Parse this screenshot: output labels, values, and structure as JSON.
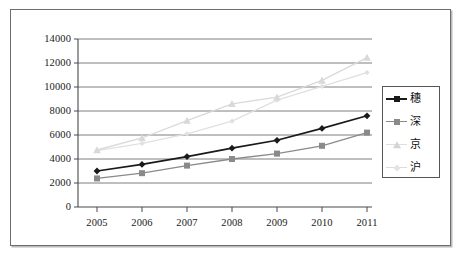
{
  "chart_data": {
    "type": "line",
    "title": "",
    "xlabel": "",
    "ylabel": "",
    "categories": [
      "2005",
      "2006",
      "2007",
      "2008",
      "2009",
      "2010",
      "2011"
    ],
    "x": [
      2005,
      2006,
      2007,
      2008,
      2009,
      2010,
      2011
    ],
    "ylim": [
      0,
      14000
    ],
    "ytick_step": 2000,
    "yticks": [
      "0",
      "2000",
      "4000",
      "6000",
      "8000",
      "10000",
      "12000",
      "14000"
    ],
    "grid": "horizontal",
    "legend_position": "right",
    "series": [
      {
        "name": "穗",
        "marker": "diamond",
        "color": "#1a1a1a",
        "values": [
          3000,
          3550,
          4200,
          4900,
          5560,
          6550,
          7600
        ]
      },
      {
        "name": "深",
        "marker": "square",
        "color": "#8a8a8a",
        "values": [
          2380,
          2820,
          3450,
          4000,
          4450,
          5100,
          6200
        ]
      },
      {
        "name": "京",
        "marker": "triangle",
        "color": "#d9d9d9",
        "values": [
          4750,
          5750,
          7200,
          8600,
          9150,
          10550,
          12450
        ]
      },
      {
        "name": "沪",
        "marker": "line",
        "color": "#e0e0e0",
        "values": [
          4700,
          5300,
          6100,
          7150,
          8900,
          10050,
          11200
        ]
      }
    ]
  },
  "axis": {
    "y_ticks": [
      "14000",
      "12000",
      "10000",
      "8000",
      "6000",
      "4000",
      "2000",
      "0"
    ],
    "x_ticks": [
      "2005",
      "2006",
      "2007",
      "2008",
      "2009",
      "2010",
      "2011"
    ]
  },
  "legend": {
    "items": [
      {
        "label": "穗",
        "marker": "diamond-marker",
        "color": "#1a1a1a"
      },
      {
        "label": "深",
        "marker": "square-marker",
        "color": "#8a8a8a"
      },
      {
        "label": "京",
        "marker": "triangle-marker",
        "color": "#d4d4d4"
      },
      {
        "label": "沪",
        "marker": "line-marker",
        "color": "#dcdcdc"
      }
    ]
  },
  "colors": {
    "frame_border": "#6e6e6e",
    "axis": "#4a4a4a",
    "gridline": "#6f6f6f",
    "background": "#ffffff"
  }
}
